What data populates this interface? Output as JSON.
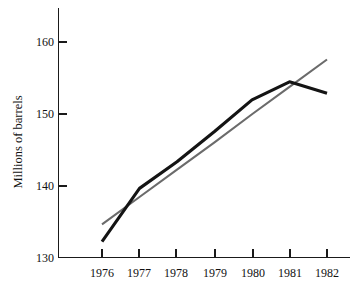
{
  "chart_data": {
    "type": "line",
    "title": "",
    "xlabel": "",
    "ylabel": "Millions of barrels",
    "x": [
      1976,
      1977,
      1978,
      1979,
      1980,
      1981,
      1982
    ],
    "xtick_labels": [
      "1976",
      "1977",
      "1978",
      "1979",
      "1980",
      "1981",
      "1982"
    ],
    "ytick_labels": [
      "130",
      "140",
      "150",
      "160"
    ],
    "yticks": [
      130,
      140,
      150,
      160
    ],
    "xlim": [
      1975.6,
      1982.4
    ],
    "ylim": [
      130,
      163
    ],
    "grid": false,
    "legend": "none",
    "series": [
      {
        "name": "Actual production",
        "color": "#141414",
        "width": 3.1,
        "values": [
          132.2,
          139.6,
          143.3,
          147.5,
          151.9,
          154.4,
          152.8
        ]
      },
      {
        "name": "Trend line",
        "color": "#6b6b6b",
        "width": 2.1,
        "values": [
          134.6,
          138.4,
          142.2,
          146.0,
          149.9,
          153.7,
          157.5
        ]
      }
    ]
  },
  "axes": {
    "y_axis_label": "Millions of barrels",
    "y_tick_130": "130",
    "y_tick_140": "140",
    "y_tick_150": "150",
    "y_tick_160": "160",
    "x_tick_1976": "1976",
    "x_tick_1977": "1977",
    "x_tick_1978": "1978",
    "x_tick_1979": "1979",
    "x_tick_1980": "1980",
    "x_tick_1981": "1981",
    "x_tick_1982": "1982"
  }
}
